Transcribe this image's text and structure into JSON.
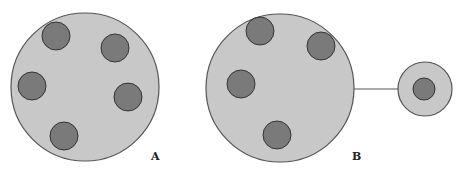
{
  "diagram": {
    "colors": {
      "outer_fill": "#c8c8c8",
      "outer_stroke": "#555555",
      "inner_fill": "#7a7a7a",
      "inner_stroke": "#333333",
      "connector": "#555555"
    },
    "panels": [
      {
        "label": "A",
        "outer": {
          "cx": 85,
          "cy": 87,
          "r": 74
        },
        "inner": [
          {
            "cx": 56,
            "cy": 36,
            "r": 14
          },
          {
            "cx": 115,
            "cy": 48,
            "r": 14
          },
          {
            "cx": 32,
            "cy": 86,
            "r": 14
          },
          {
            "cx": 128,
            "cy": 97,
            "r": 14
          },
          {
            "cx": 64,
            "cy": 136,
            "r": 14
          }
        ]
      },
      {
        "label": "B",
        "outer": {
          "cx": 280,
          "cy": 88,
          "r": 74
        },
        "inner": [
          {
            "cx": 260,
            "cy": 31,
            "r": 14
          },
          {
            "cx": 321,
            "cy": 46,
            "r": 14
          },
          {
            "cx": 241,
            "cy": 84,
            "r": 14
          },
          {
            "cx": 277,
            "cy": 135,
            "r": 14
          }
        ],
        "connector": {
          "x1": 354,
          "y1": 89,
          "x2": 398,
          "y2": 89
        },
        "satellite": {
          "outer": {
            "cx": 425,
            "cy": 89,
            "r": 27
          },
          "inner": {
            "cx": 424,
            "cy": 89,
            "r": 11
          }
        }
      }
    ]
  },
  "labels": {
    "a": "A",
    "b": "B"
  }
}
